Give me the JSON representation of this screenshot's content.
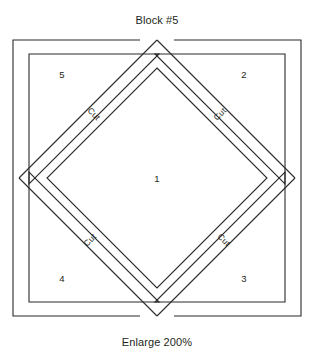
{
  "document": {
    "title": "Block #5",
    "caption": "Enlarge 200%"
  },
  "diagram": {
    "type": "quilt-block-cutting-template",
    "shape": "square-with-central-diamond",
    "pieces": [
      {
        "id": "1",
        "label": "1",
        "region": "center-diamond"
      },
      {
        "id": "2",
        "label": "2",
        "region": "top-right-triangle"
      },
      {
        "id": "3",
        "label": "3",
        "region": "bottom-right-triangle"
      },
      {
        "id": "4",
        "label": "4",
        "region": "bottom-left-triangle"
      },
      {
        "id": "5",
        "label": "5",
        "region": "top-left-triangle"
      }
    ],
    "cut_lines": [
      {
        "id": "cut-top-left",
        "label": "Cut"
      },
      {
        "id": "cut-top-right",
        "label": "Cut"
      },
      {
        "id": "cut-bottom-left",
        "label": "Cut"
      },
      {
        "id": "cut-bottom-right",
        "label": "Cut"
      }
    ],
    "colors": {
      "line": "#2b2b2b",
      "text": "#231f20",
      "background": "#ffffff"
    }
  }
}
